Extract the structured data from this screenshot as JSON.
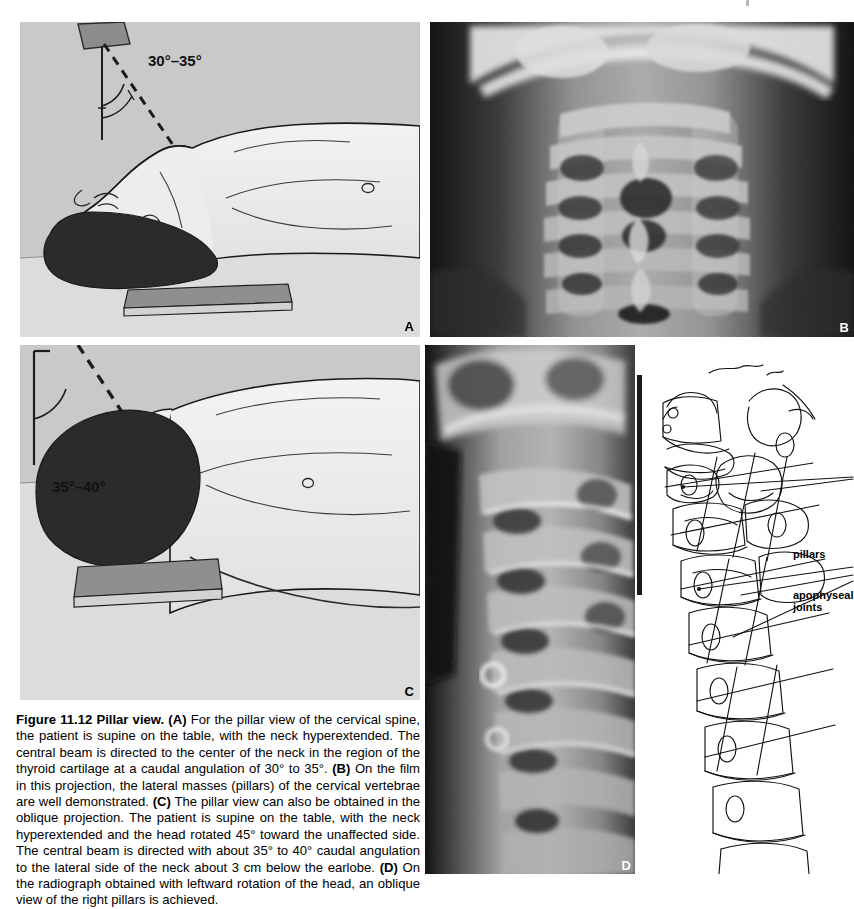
{
  "figure": {
    "number": "Figure 11.12",
    "title": "Pillar view.",
    "caption_segments": [
      {
        "type": "bold",
        "text": "Figure 11.12"
      },
      {
        "type": "space",
        "text": "  "
      },
      {
        "type": "bold",
        "text": "Pillar view."
      },
      {
        "type": "text",
        "text": " "
      },
      {
        "type": "bold",
        "text": "(A)"
      },
      {
        "type": "text",
        "text": " For the pillar view of the cervical spine, the patient is supine on the table, with the neck hyperextended. The central beam is directed to the center of the neck in the region of the thyroid cartilage at a caudal angulation of 30° to 35°. "
      },
      {
        "type": "bold",
        "text": "(B)"
      },
      {
        "type": "text",
        "text": " On the film in this projection, the lateral masses (pillars) of the cervical vertebrae are well demonstrated. "
      },
      {
        "type": "bold",
        "text": "(C)"
      },
      {
        "type": "text",
        "text": " The pillar view can also be obtained in the oblique projection. The patient is supine on the table, with the neck hyperextended and the head rotated 45° toward the unaffected side. The central beam is directed with about 35° to 40° caudal angulation to the lateral side of the neck about 3 cm below the earlobe. "
      },
      {
        "type": "bold",
        "text": "(D)"
      },
      {
        "type": "text",
        "text": " On the radiograph obtained with leftward rotation of the head, an oblique view of the right pillars is achieved."
      }
    ],
    "caption_plain": "Figure 11.12  Pillar view. (A) For the pillar view of the cervical spine, the patient is supine on the table, with the neck hyperextended. The central beam is directed to the center of the neck in the region of the thyroid cartilage at a caudal angulation of 30° to 35°. (B) On the film in this projection, the lateral masses (pillars) of the cervical vertebrae are well demonstrated. (C) The pillar view can also be obtained in the oblique projection. The patient is supine on the table, with the neck hyperextended and the head rotated 45° toward the unaffected side. The central beam is directed with about 35° to 40° caudal angulation to the lateral side of the neck about 3 cm below the earlobe. (D) On the radiograph obtained with leftward rotation of the head, an oblique view of the right pillars is achieved."
  },
  "panels": {
    "a": {
      "letter": "A",
      "kind": "illustration",
      "description": "Supine patient with neck hyperextended, X-ray tube angled above the neck",
      "angle_label": "30°–35°"
    },
    "b": {
      "letter": "B",
      "kind": "radiograph",
      "description": "AP pillar view radiograph of the cervical spine"
    },
    "c": {
      "letter": "C",
      "kind": "illustration",
      "description": "Supine patient with head rotated, oblique pillar view positioning",
      "angle_label": "35°–40°"
    },
    "d": {
      "letter": "D",
      "kind": "radiograph",
      "description": "Oblique cervical spine radiograph showing the right pillars"
    },
    "tracing": {
      "kind": "line-drawing",
      "description": "Line-drawing tracing of the oblique radiograph",
      "labels": [
        {
          "id": "pillars",
          "text": "pillars"
        },
        {
          "id": "apophyseal-joints",
          "text": "apophyseal\njoints"
        }
      ]
    }
  },
  "colors": {
    "illustration_bg": "#c9c9c9",
    "illustration_floor": "#dedede",
    "hair": "#2b2b2b",
    "table": "#8f8f8f",
    "skin": "#ececec",
    "ink": "#111111",
    "radiograph_bg": "#0d0d0d",
    "page_bg": "#ffffff"
  }
}
